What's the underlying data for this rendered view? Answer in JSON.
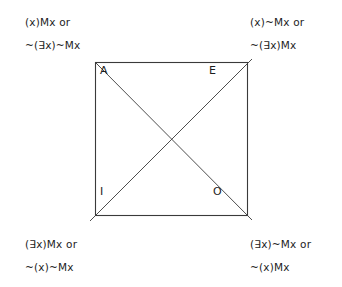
{
  "figure": {
    "kind": "square-of-opposition",
    "background_color": "#ffffff",
    "stroke_color": "#3a3a3a",
    "text_color": "#1d1d1d"
  },
  "square": {
    "left": 95,
    "top": 62,
    "right": 248,
    "bottom": 216
  },
  "corners": {
    "a": {
      "letter": "A",
      "position": "top-left"
    },
    "e": {
      "letter": "E",
      "position": "top-right"
    },
    "i": {
      "letter": "I",
      "position": "bottom-left"
    },
    "o": {
      "letter": "O",
      "position": "bottom-right"
    }
  },
  "formulas": {
    "a": {
      "line1": "(x)Mx or",
      "line2": "~(∃x)~Mx"
    },
    "e": {
      "line1": "(x)~Mx or",
      "line2": "~(∃x)Mx"
    },
    "i": {
      "line1": "(∃x)Mx or",
      "line2": "~(x)~Mx"
    },
    "o": {
      "line1": "(∃x)~Mx or",
      "line2": "~(x)Mx"
    }
  },
  "diagonals": {
    "a_to_o": {
      "x1": 95,
      "y1": 62,
      "x2": 252,
      "y2": 220
    },
    "i_to_e": {
      "x1": 90,
      "y1": 221,
      "x2": 252,
      "y2": 59
    }
  }
}
